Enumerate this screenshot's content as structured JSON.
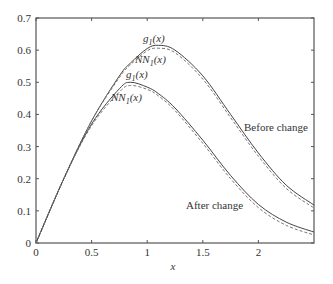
{
  "chart_data": {
    "type": "line",
    "title": "",
    "xlabel": "x",
    "ylabel": "",
    "xlim": [
      0,
      2.5
    ],
    "ylim": [
      0,
      0.7
    ],
    "grid": false,
    "legend": "none (inline labels)",
    "x_ticks": [
      "0",
      "0.5",
      "1",
      "1.5",
      "2"
    ],
    "y_ticks": [
      "0",
      "0.1",
      "0.2",
      "0.3",
      "0.4",
      "0.5",
      "0.6",
      "0.7"
    ],
    "x": [
      0,
      0.25,
      0.5,
      0.75,
      0.85,
      1.0,
      1.1,
      1.25,
      1.5,
      1.75,
      2.0,
      2.25,
      2.5
    ],
    "series": [
      {
        "name": "g1(x) before change",
        "style": "solid",
        "values": [
          0,
          0.2,
          0.38,
          0.52,
          0.56,
          0.605,
          0.615,
          0.6,
          0.52,
          0.4,
          0.28,
          0.18,
          0.118
        ]
      },
      {
        "name": "NN1(x) before change",
        "style": "dashed",
        "values": [
          0,
          0.2,
          0.38,
          0.515,
          0.555,
          0.598,
          0.606,
          0.592,
          0.51,
          0.39,
          0.27,
          0.17,
          0.109
        ]
      },
      {
        "name": "g1(x) after change",
        "style": "solid",
        "values": [
          0,
          0.2,
          0.37,
          0.48,
          0.5,
          0.485,
          0.465,
          0.42,
          0.32,
          0.21,
          0.12,
          0.065,
          0.034
        ]
      },
      {
        "name": "NN1(x) after change",
        "style": "dashed",
        "values": [
          0,
          0.2,
          0.365,
          0.47,
          0.49,
          0.478,
          0.458,
          0.412,
          0.31,
          0.2,
          0.11,
          0.055,
          0.025
        ]
      }
    ],
    "annotations": [
      {
        "text": "g₁(x)",
        "x": 1.1,
        "y": 0.645
      },
      {
        "text": "NN₁(x)",
        "x": 1.15,
        "y": 0.575
      },
      {
        "text": "g₁(x)",
        "x": 0.85,
        "y": 0.525
      },
      {
        "text": "NN₁(x)",
        "x": 0.7,
        "y": 0.455
      },
      {
        "text": "Before change",
        "x": 2.1,
        "y": 0.37
      },
      {
        "text": "After change",
        "x": 1.5,
        "y": 0.1
      }
    ]
  },
  "labels": {
    "xlabel": "x",
    "before": "Before change",
    "after": "After change",
    "g_upper": "g",
    "nn_upper": "NN",
    "g_lower": "g",
    "nn_lower": "NN",
    "sub": "1",
    "arg": "(x)"
  }
}
